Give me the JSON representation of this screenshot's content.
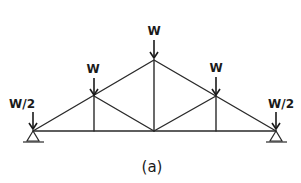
{
  "figure": {
    "caption": "(a)",
    "type": "roof truss with point loads",
    "line_color": "#2a2a2a"
  },
  "loads": [
    {
      "id": "left-support",
      "label": "W/2"
    },
    {
      "id": "left-panel",
      "label": "W"
    },
    {
      "id": "apex",
      "label": "W"
    },
    {
      "id": "right-panel",
      "label": "W"
    },
    {
      "id": "right-support",
      "label": "W/2"
    }
  ],
  "supports": [
    {
      "id": "left",
      "type": "pin"
    },
    {
      "id": "right",
      "type": "pin"
    }
  ]
}
